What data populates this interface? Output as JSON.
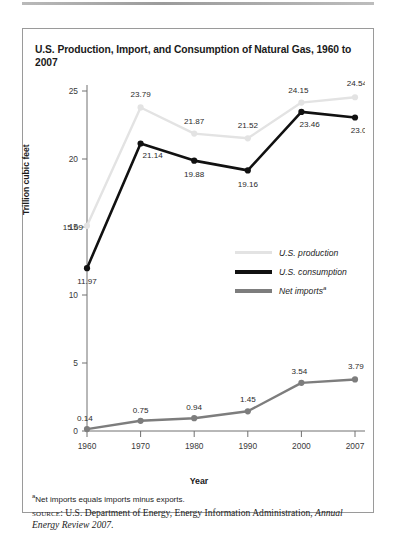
{
  "figure": {
    "title": "U.S. Production, Import, and Consumption of Natural Gas, 1960 to 2007",
    "footnote_marker": "a",
    "footnote_text": "Net imports equals imports minus exports.",
    "source_label": "source",
    "source_separator": ": ",
    "source_text": "U.S. Department of Energy, Energy Information Administration, ",
    "source_italic": "Annual Energy Review 2007",
    "source_period": "."
  },
  "legend": {
    "items": [
      {
        "label": "U.S. production",
        "color": "#e3e3e3",
        "marker": ""
      },
      {
        "label": "U.S. consumption",
        "color": "#111111",
        "marker": ""
      },
      {
        "label": "Net imports",
        "color": "#7d7d7d",
        "marker": "a"
      }
    ]
  },
  "chart_data": {
    "type": "line",
    "title": "U.S. Production, Import, and Consumption of Natural Gas, 1960 to 2007",
    "xlabel": "Year",
    "ylabel": "Trillion cubic feet",
    "categories": [
      "1960",
      "1970",
      "1980",
      "1990",
      "2000",
      "2007"
    ],
    "x_ticks": [
      "1960",
      "1970",
      "1980",
      "1990",
      "2000",
      "2007"
    ],
    "y_ticks": [
      "0",
      "5",
      "10",
      "15",
      "20",
      "25"
    ],
    "ylim": [
      0,
      25
    ],
    "grid": false,
    "legend_position": "inside-right-middle",
    "series": [
      {
        "name": "U.S. production",
        "color": "#e3e3e3",
        "values": [
          15.09,
          23.79,
          21.87,
          21.52,
          24.15,
          24.54
        ],
        "labels": [
          "15.09",
          "23.79",
          "21.87",
          "21.52",
          "24.15",
          "24.54"
        ]
      },
      {
        "name": "U.S. consumption",
        "color": "#111111",
        "values": [
          11.97,
          21.14,
          19.88,
          19.16,
          23.46,
          23.05
        ],
        "labels": [
          "11.97",
          "21.14",
          "19.88",
          "19.16",
          "23.46",
          "23.05"
        ]
      },
      {
        "name": "Net imports",
        "color": "#7d7d7d",
        "values": [
          0.14,
          0.75,
          0.94,
          1.45,
          3.54,
          3.79
        ],
        "labels": [
          "0.14",
          "0.75",
          "0.94",
          "1.45",
          "3.54",
          "3.79"
        ]
      }
    ]
  }
}
